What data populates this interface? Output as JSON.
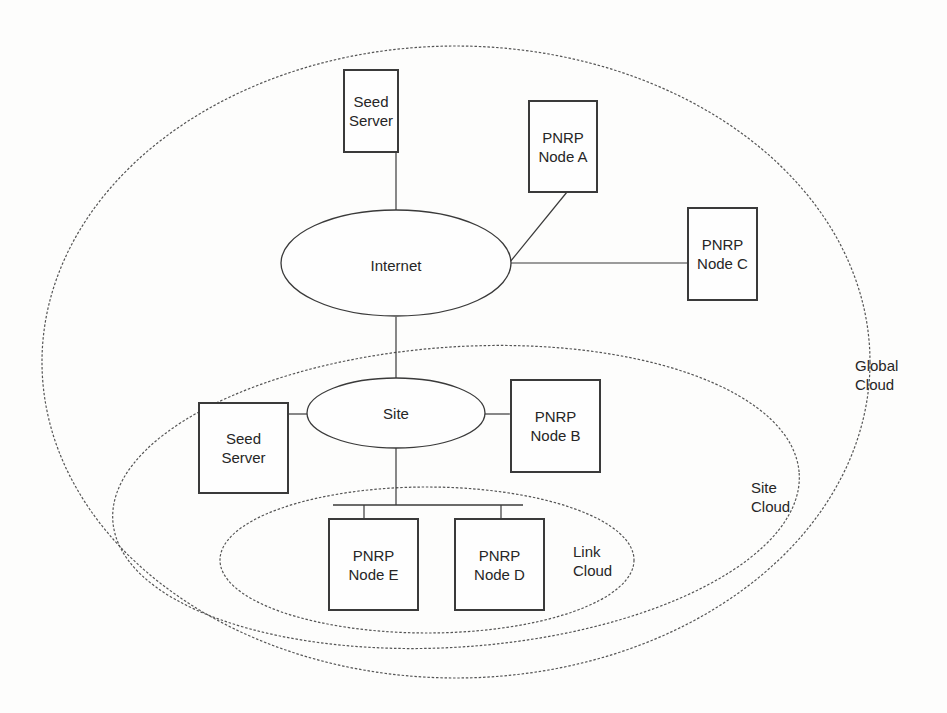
{
  "diagram": {
    "type": "network-topology",
    "clouds": [
      {
        "id": "global",
        "label_line1": "Global",
        "label_line2": "Cloud"
      },
      {
        "id": "site",
        "label_line1": "Site",
        "label_line2": "Cloud"
      },
      {
        "id": "link",
        "label_line1": "Link",
        "label_line2": "Cloud"
      }
    ],
    "networks": {
      "internet": {
        "label": "Internet"
      },
      "site": {
        "label": "Site"
      }
    },
    "nodes": {
      "seed_server_global": {
        "line1": "Seed",
        "line2": "Server"
      },
      "node_a": {
        "line1": "PNRP",
        "line2": "Node A"
      },
      "node_c": {
        "line1": "PNRP",
        "line2": "Node C"
      },
      "seed_server_site": {
        "line1": "Seed",
        "line2": "Server"
      },
      "node_b": {
        "line1": "PNRP",
        "line2": "Node B"
      },
      "node_e": {
        "line1": "PNRP",
        "line2": "Node E"
      },
      "node_d": {
        "line1": "PNRP",
        "line2": "Node D"
      }
    },
    "connections": [
      [
        "seed_server_global",
        "internet"
      ],
      [
        "node_a",
        "internet"
      ],
      [
        "node_c",
        "internet"
      ],
      [
        "internet",
        "site"
      ],
      [
        "seed_server_site",
        "site"
      ],
      [
        "node_b",
        "site"
      ],
      [
        "site",
        "link_bus"
      ],
      [
        "link_bus",
        "node_e"
      ],
      [
        "link_bus",
        "node_d"
      ]
    ],
    "colors": {
      "stroke": "#3a3a3a",
      "dashed": "#555555",
      "background": "#fdfdfc",
      "text": "#262626"
    }
  }
}
